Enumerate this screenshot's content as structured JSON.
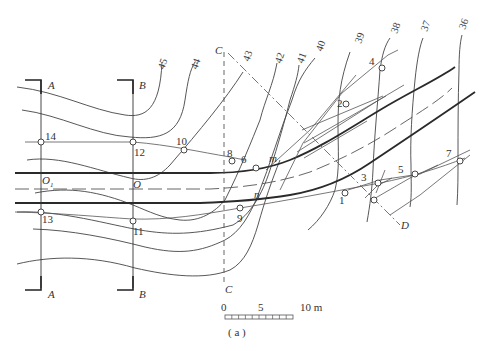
{
  "figure": {
    "caption": "( a )",
    "scale_bar": {
      "labels": [
        "0",
        "5",
        "10 m"
      ],
      "divisions": 10
    },
    "section_labels": {
      "A_top": "A",
      "A_bottom": "A",
      "B_top": "B",
      "B_bottom": "B",
      "C_top": "C",
      "C_bottom": "C",
      "D": "D"
    },
    "contour_labels": [
      "45",
      "44",
      "43",
      "42",
      "41",
      "40",
      "39",
      "38",
      "37",
      "36"
    ],
    "point_labels": [
      "1",
      "2",
      "3",
      "4",
      "5",
      "6",
      "7",
      "8",
      "9",
      "10",
      "11",
      "12",
      "13",
      "14"
    ],
    "centre_labels": {
      "O1": "O",
      "O1_sub": "1",
      "O": "O"
    },
    "edge_labels": {
      "m": "m",
      "n": "n"
    }
  }
}
